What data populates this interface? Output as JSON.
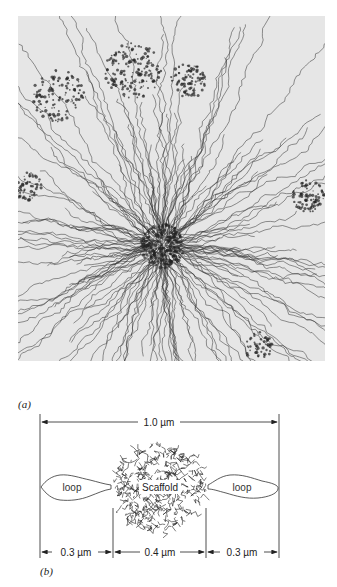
{
  "figure": {
    "panel_a": {
      "label": "(a)",
      "description": "Electron micrograph of a histone-depleted metaphase chromosome showing DNA loops radiating from a central protein scaffold"
    },
    "panel_b": {
      "label": "(b)",
      "total_width_label": "1.0 µm",
      "left_loop_label": "loop",
      "right_loop_label": "loop",
      "center_label": "Scaffold",
      "segments": [
        {
          "label": "0.3 µm",
          "value": 0.3,
          "unit": "µm"
        },
        {
          "label": "0.4 µm",
          "value": 0.4,
          "unit": "µm"
        },
        {
          "label": "0.3 µm",
          "value": 0.3,
          "unit": "µm"
        }
      ]
    }
  },
  "colors": {
    "background": "#ffffff",
    "micrograph_bg": "#e6e6e6",
    "ink": "#222222"
  }
}
